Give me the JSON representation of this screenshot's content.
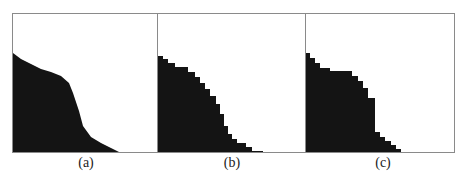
{
  "figure": {
    "panels": [
      {
        "id": "a",
        "label": "(a)",
        "description": "Noisy raw segmentation of dark region with ragged boundary",
        "boundary": [
          [
            0,
            39
          ],
          [
            8,
            45
          ],
          [
            18,
            50
          ],
          [
            28,
            55
          ],
          [
            38,
            58
          ],
          [
            48,
            62
          ],
          [
            56,
            69
          ],
          [
            60,
            79
          ],
          [
            66,
            97
          ],
          [
            70,
            112
          ],
          [
            78,
            123
          ],
          [
            88,
            129
          ],
          [
            98,
            134
          ],
          [
            108,
            139
          ],
          [
            110,
            140
          ]
        ]
      },
      {
        "id": "b",
        "label": "(b)",
        "description": "Medium-resolution blocky approximation of region",
        "boundary": [
          [
            0,
            42
          ],
          [
            5,
            45
          ],
          [
            10,
            49
          ],
          [
            17,
            53
          ],
          [
            30,
            58
          ],
          [
            37,
            63
          ],
          [
            42,
            69
          ],
          [
            47,
            75
          ],
          [
            52,
            82
          ],
          [
            58,
            90
          ],
          [
            62,
            100
          ],
          [
            66,
            112
          ],
          [
            70,
            120
          ],
          [
            74,
            125
          ],
          [
            79,
            129
          ],
          [
            88,
            133
          ],
          [
            94,
            137
          ],
          [
            105,
            140
          ],
          [
            110,
            140
          ]
        ]
      },
      {
        "id": "c",
        "label": "(c)",
        "description": "Coarse staircase approximation of region",
        "boundary": [
          [
            0,
            39
          ],
          [
            4,
            44
          ],
          [
            9,
            49
          ],
          [
            14,
            54
          ],
          [
            24,
            57
          ],
          [
            46,
            62
          ],
          [
            52,
            67
          ],
          [
            57,
            74
          ],
          [
            62,
            84
          ],
          [
            69,
            118
          ],
          [
            74,
            123
          ],
          [
            79,
            127
          ],
          [
            85,
            131
          ],
          [
            90,
            135
          ],
          [
            95,
            140
          ]
        ]
      }
    ],
    "colors": {
      "fill": "#141414",
      "border": "#8a8a8a",
      "background": "#ffffff"
    }
  }
}
